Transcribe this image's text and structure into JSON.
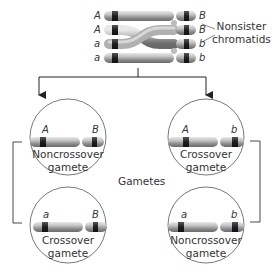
{
  "diagram": {
    "type": "crossing-over-gametes",
    "top": {
      "label_line1": "Nonsister",
      "label_line2": "chromatids",
      "chromatids": [
        {
          "left": "A",
          "right": "B"
        },
        {
          "left": "A",
          "right": "B"
        },
        {
          "left": "a",
          "right": "b"
        },
        {
          "left": "a",
          "right": "b"
        }
      ]
    },
    "center_label": "Gametes",
    "gametes": [
      {
        "position": "top-left",
        "left": "A",
        "right": "B",
        "line1": "Noncrossover",
        "line2": "gamete"
      },
      {
        "position": "bottom-left",
        "left": "a",
        "right": "B",
        "line1": "Crossover",
        "line2": "gamete"
      },
      {
        "position": "top-right",
        "left": "A",
        "right": "b",
        "line1": "Crossover",
        "line2": "gamete"
      },
      {
        "position": "bottom-right",
        "left": "a",
        "right": "b",
        "line1": "Noncrossover",
        "line2": "gamete"
      }
    ],
    "colors": {
      "chromosome_body": "#b8b8b8",
      "chromosome_dark_band": "#2a2a2a",
      "line": "#333333",
      "circle_stroke": "#555555"
    }
  }
}
